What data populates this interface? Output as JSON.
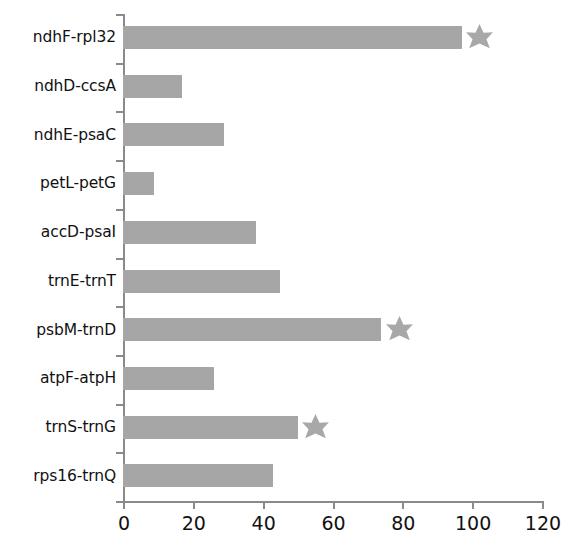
{
  "chart_data": {
    "type": "bar",
    "orientation": "horizontal",
    "title": "",
    "xlabel": "",
    "ylabel": "",
    "xlim": [
      0,
      120
    ],
    "xticks": [
      0,
      20,
      40,
      60,
      80,
      100,
      120
    ],
    "xtick_labels": [
      "0",
      "20",
      "40",
      "60",
      "80",
      "100",
      "120"
    ],
    "grid": false,
    "legend": null,
    "bar_color": "#a6a6a6",
    "marker_color": "#a8a8a8",
    "marker_symbol": "star",
    "axis_color": "#8a8a8a",
    "categories": [
      "ndhF-rpl32",
      "ndhD-ccsA",
      "ndhE-psaC",
      "petL-petG",
      "accD-psaI",
      "trnE-trnT",
      "psbM-trnD",
      "atpF-atpH",
      "trnS-trnG",
      "rps16-trnQ"
    ],
    "values": [
      97,
      17,
      29,
      9,
      38,
      45,
      74,
      26,
      50,
      43
    ],
    "annotations": [
      {
        "category": "ndhF-rpl32",
        "marker": "star",
        "x": 102
      },
      {
        "category": "psbM-trnD",
        "marker": "star",
        "x": 79
      },
      {
        "category": "trnS-trnG",
        "marker": "star",
        "x": 55
      }
    ]
  }
}
